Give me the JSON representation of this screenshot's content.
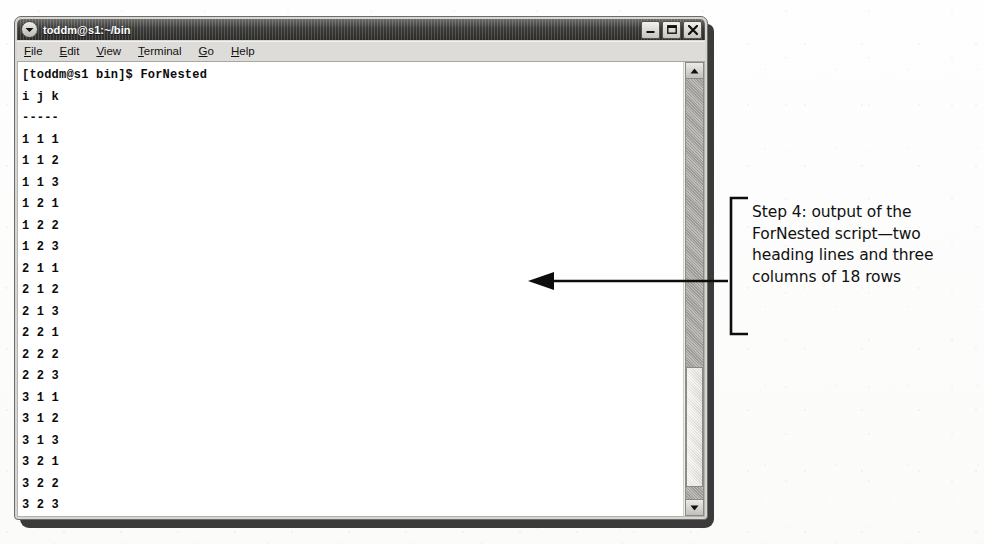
{
  "window": {
    "title": "toddm@s1:~/bin",
    "title_menu_icon": "chevron-down-icon",
    "buttons": [
      {
        "name": "minimize",
        "icon": "minimize-icon",
        "label": "–"
      },
      {
        "name": "maximize",
        "icon": "maximize-icon",
        "label": "□"
      },
      {
        "name": "close",
        "icon": "close-icon",
        "label": "✕"
      }
    ]
  },
  "menubar": {
    "items": [
      {
        "label": "File",
        "mnemonic": "F"
      },
      {
        "label": "Edit",
        "mnemonic": "E"
      },
      {
        "label": "View",
        "mnemonic": "V"
      },
      {
        "label": "Terminal",
        "mnemonic": "T"
      },
      {
        "label": "Go",
        "mnemonic": "G"
      },
      {
        "label": "Help",
        "mnemonic": "H"
      }
    ]
  },
  "terminal": {
    "lines": [
      "[toddm@s1 bin]$ ForNested",
      "i j k",
      "-----",
      "1 1 1",
      "1 1 2",
      "1 1 3",
      "1 2 1",
      "1 2 2",
      "1 2 3",
      "2 1 1",
      "2 1 2",
      "2 1 3",
      "2 2 1",
      "2 2 2",
      "2 2 3",
      "3 1 1",
      "3 1 2",
      "3 1 3",
      "3 2 1",
      "3 2 2",
      "3 2 3",
      "[toddm@s1 bin]$"
    ]
  },
  "scrollbar": {
    "up_icon": "scroll-up-arrow-icon",
    "down_icon": "scroll-down-arrow-icon"
  },
  "annotation": {
    "text": "Step 4: output of the ForNested script—two heading lines and three columns of 18 rows",
    "pointer_icon": "left-arrow-icon",
    "bracket_icon": "bracket-icon"
  },
  "colors": {
    "titlebar": "#2b2b29",
    "window_chrome": "#d8d6d2",
    "terminal_bg": "#ffffff",
    "terminal_fg": "#0b0b0b",
    "annotation_fg": "#101010"
  }
}
